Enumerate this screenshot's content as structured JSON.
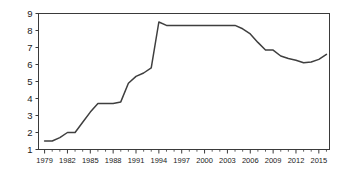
{
  "chart_data": {
    "type": "line",
    "title": "",
    "subtitle": "",
    "xlabel": "",
    "ylabel": "",
    "xlim": [
      1978.2,
      2016.4
    ],
    "ylim": [
      1,
      9
    ],
    "grid": false,
    "legend": null,
    "y_ticks": [
      1,
      2,
      3,
      4,
      5,
      6,
      7,
      8,
      9
    ],
    "y_tick_labels": [
      "1",
      "2",
      "3",
      "4",
      "5",
      "6",
      "7",
      "8",
      "9"
    ],
    "x_ticks": [
      1979,
      1982,
      1985,
      1988,
      1991,
      1994,
      1997,
      2000,
      2003,
      2006,
      2009,
      2012,
      2015
    ],
    "x_tick_labels": [
      "1979",
      "1982",
      "1985",
      "1988",
      "1991",
      "1994",
      "1997",
      "2000",
      "2003",
      "2006",
      "2009",
      "2012",
      "2015"
    ],
    "x_minor_tick_step": 1,
    "line_color": "#3f3f3f",
    "series": [
      {
        "name": "series-1",
        "x": [
          1979,
          1980,
          1981,
          1982,
          1983,
          1984,
          1985,
          1986,
          1987,
          1988,
          1989,
          1990,
          1991,
          1992,
          1993,
          1994,
          1995,
          1996,
          1997,
          1998,
          1999,
          2000,
          2001,
          2002,
          2003,
          2004,
          2005,
          2006,
          2007,
          2008,
          2009,
          2010,
          2011,
          2012,
          2013,
          2014,
          2015,
          2016
        ],
        "y": [
          1.5,
          1.5,
          1.7,
          2.0,
          2.0,
          2.6,
          3.2,
          3.7,
          3.7,
          3.7,
          3.8,
          4.9,
          5.3,
          5.5,
          5.8,
          8.5,
          8.3,
          8.3,
          8.3,
          8.3,
          8.3,
          8.3,
          8.3,
          8.3,
          8.3,
          8.3,
          8.1,
          7.8,
          7.3,
          6.85,
          6.85,
          6.5,
          6.35,
          6.25,
          6.1,
          6.15,
          6.3,
          6.6
        ]
      }
    ]
  }
}
